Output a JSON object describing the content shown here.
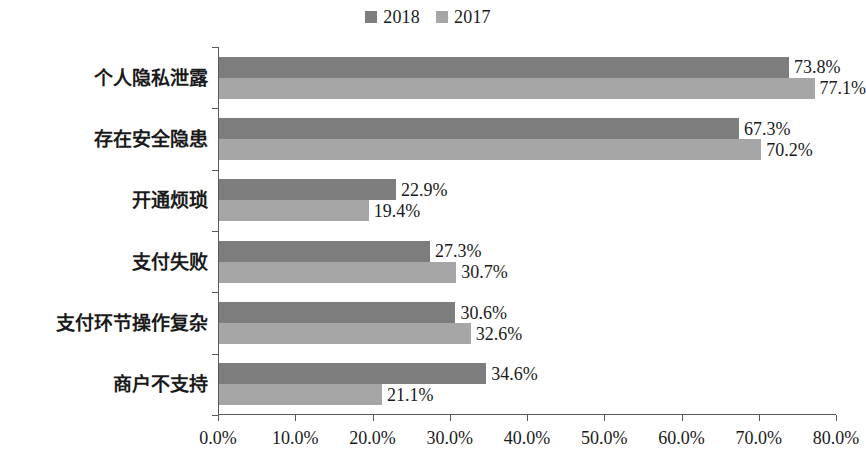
{
  "chart_data": {
    "type": "bar",
    "orientation": "horizontal",
    "title": "",
    "xlabel": "",
    "ylabel": "",
    "xlim": [
      0,
      80
    ],
    "xticks": [
      0,
      10,
      20,
      30,
      40,
      50,
      60,
      70,
      80
    ],
    "xtick_labels": [
      "0.0%",
      "10.0%",
      "20.0%",
      "30.0%",
      "40.0%",
      "50.0%",
      "60.0%",
      "70.0%",
      "80.0%"
    ],
    "grid": false,
    "legend_position": "top-center",
    "categories": [
      "个人隐私泄露",
      "存在安全隐患",
      "开通烦琐",
      "支付失败",
      "支付环节操作复杂",
      "商户不支持"
    ],
    "series": [
      {
        "name": "2018",
        "color": "#7d7d7d",
        "values": [
          73.8,
          67.3,
          22.9,
          27.3,
          30.6,
          34.6
        ],
        "labels": [
          "73.8%",
          "67.3%",
          "22.9%",
          "27.3%",
          "30.6%",
          "34.6%"
        ]
      },
      {
        "name": "2017",
        "color": "#a6a6a6",
        "values": [
          77.1,
          70.2,
          19.4,
          30.7,
          32.6,
          21.1
        ],
        "labels": [
          "77.1%",
          "70.2%",
          "19.4%",
          "30.7%",
          "32.6%",
          "21.1%"
        ]
      }
    ]
  },
  "legend": {
    "entries": [
      {
        "label": "2018",
        "color": "#7d7d7d"
      },
      {
        "label": "2017",
        "color": "#a6a6a6"
      }
    ]
  },
  "axis": {
    "line_color": "#595959"
  }
}
